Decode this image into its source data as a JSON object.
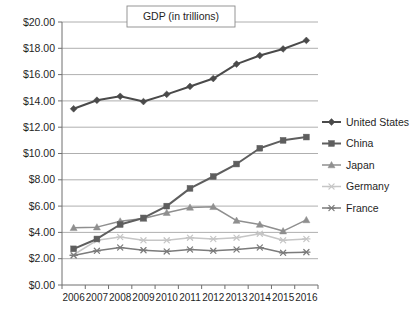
{
  "chart_data": {
    "type": "line",
    "title": "GDP (in trillions)",
    "xlabel": "",
    "ylabel": "",
    "categories": [
      "2006",
      "2007",
      "2008",
      "2009",
      "2010",
      "2011",
      "2012",
      "2013",
      "2014",
      "2015",
      "2016"
    ],
    "ylim": [
      0,
      20
    ],
    "ytick_labels": [
      "$0.00",
      "$2.00",
      "$4.00",
      "$6.00",
      "$8.00",
      "$10.00",
      "$12.00",
      "$14.00",
      "$16.00",
      "$18.00",
      "$20.00"
    ],
    "ytick_values": [
      0,
      2,
      4,
      6,
      8,
      10,
      12,
      14,
      16,
      18,
      20
    ],
    "grid": true,
    "legend_position": "right",
    "series": [
      {
        "name": "United States",
        "marker": "diamond",
        "color": "#4a4a4a",
        "values": [
          13.4,
          14.05,
          14.35,
          13.95,
          14.5,
          15.1,
          15.7,
          16.8,
          17.45,
          17.95,
          18.6
        ]
      },
      {
        "name": "China",
        "marker": "square",
        "color": "#5e5e5e",
        "values": [
          2.75,
          3.5,
          4.6,
          5.1,
          6.0,
          7.35,
          8.25,
          9.2,
          10.4,
          11.0,
          11.25
        ]
      },
      {
        "name": "Japan",
        "marker": "triangle",
        "color": "#8f8f8f",
        "values": [
          4.35,
          4.4,
          4.85,
          5.05,
          5.5,
          5.9,
          5.95,
          4.9,
          4.6,
          4.1,
          4.95
        ]
      },
      {
        "name": "Germany",
        "marker": "asterisk",
        "color": "#c6c6c6",
        "values": [
          2.3,
          3.4,
          3.65,
          3.4,
          3.4,
          3.6,
          3.5,
          3.6,
          3.9,
          3.4,
          3.5
        ]
      },
      {
        "name": "France",
        "marker": "asterisk",
        "color": "#7b7b7b",
        "values": [
          2.25,
          2.6,
          2.85,
          2.65,
          2.55,
          2.7,
          2.6,
          2.7,
          2.85,
          2.45,
          2.5
        ]
      }
    ]
  }
}
